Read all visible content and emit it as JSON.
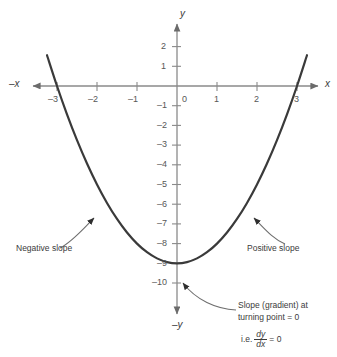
{
  "figure": {
    "type": "cartesian-graph"
  },
  "axes": {
    "x_axis_label_positive": "x",
    "x_axis_label_negative": "–x",
    "y_axis_label_positive": "y",
    "y_axis_label_negative": "–y",
    "x_ticks": [
      "–3",
      "–2",
      "–1",
      "0",
      "1",
      "2",
      "3"
    ],
    "y_ticks": [
      "2",
      "1",
      "–1",
      "–2",
      "–3",
      "–4",
      "–5",
      "–6",
      "–7",
      "–8",
      "–9",
      "–10"
    ],
    "origin_label": "0"
  },
  "annotations": {
    "negative_slope": "Negative slope",
    "positive_slope": "Positive slope",
    "turning_point_line1": "Slope (gradient) at",
    "turning_point_line2": "turning point = 0",
    "derivative_prefix": "i.e.",
    "derivative_numerator": "dy",
    "derivative_denominator": "dx",
    "derivative_equals": "= 0"
  },
  "colors": {
    "curve": "#3a3a3a",
    "axis": "#8a8a8a",
    "text": "#3b3b3b",
    "annotation_leader": "#6e6e6e",
    "background": "#ffffff"
  },
  "chart_data": {
    "type": "line",
    "title": "",
    "xlabel": "x",
    "ylabel": "y",
    "equation": "y = x^2 - 9",
    "xlim": [
      -3.4,
      3.4
    ],
    "ylim": [
      -10.8,
      2.6
    ],
    "grid": false,
    "legend": "none",
    "xticks": [
      -3,
      -2,
      -1,
      0,
      1,
      2,
      3
    ],
    "yticks": [
      2,
      1,
      -1,
      -2,
      -3,
      -4,
      -5,
      -6,
      -7,
      -8,
      -9,
      -10
    ],
    "series": [
      {
        "name": "y = x^2 - 9",
        "x": [
          -3.25,
          -3.0,
          -2.75,
          -2.5,
          -2.25,
          -2.0,
          -1.75,
          -1.5,
          -1.25,
          -1.0,
          -0.75,
          -0.5,
          -0.25,
          0,
          0.25,
          0.5,
          0.75,
          1.0,
          1.25,
          1.5,
          1.75,
          2.0,
          2.25,
          2.5,
          2.75,
          3.0,
          3.25
        ],
        "y": [
          1.5625,
          0,
          -1.4375,
          -2.75,
          -3.9375,
          -5.0,
          -5.9375,
          -6.75,
          -7.4375,
          -8.0,
          -8.4375,
          -8.75,
          -8.9375,
          -9.0,
          -8.9375,
          -8.75,
          -8.4375,
          -8.0,
          -7.4375,
          -6.75,
          -5.9375,
          -5.0,
          -3.9375,
          -2.75,
          -1.4375,
          0,
          1.5625
        ]
      }
    ],
    "key_points": {
      "turning_point": [
        0,
        -9
      ],
      "roots": [
        -3,
        3
      ]
    },
    "annotations": [
      {
        "text": "Negative slope",
        "points_to": [
          -2.0,
          -5.0
        ]
      },
      {
        "text": "Positive slope",
        "points_to": [
          2.0,
          -5.0
        ]
      },
      {
        "text": "Slope (gradient) at turning point = 0 i.e. dy/dx = 0",
        "points_to": [
          0,
          -9
        ]
      }
    ]
  }
}
